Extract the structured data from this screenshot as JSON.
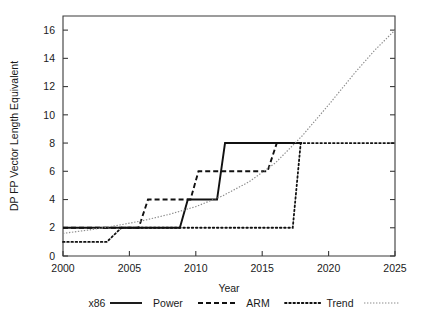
{
  "chart_data": {
    "type": "line",
    "title": "",
    "xlabel": "Year",
    "ylabel": "DP FP Vector Length Equivalent",
    "xlim": [
      2000,
      2025
    ],
    "ylim": [
      0,
      17
    ],
    "grid": false,
    "legend_position": "bottom",
    "xticks": [
      2000,
      2005,
      2010,
      2015,
      2020,
      2025
    ],
    "xticklabels": [
      "2000",
      "2005",
      "2010",
      "2015",
      "2020",
      "2025"
    ],
    "yticks": [
      0,
      2,
      4,
      6,
      8,
      10,
      12,
      14,
      16
    ],
    "yticklabels": [
      "0",
      "2",
      "4",
      "6",
      "8",
      "10",
      "12",
      "14",
      "16"
    ],
    "series": [
      {
        "name": "x86",
        "style": "solid",
        "color": "#111111",
        "step": true,
        "points": [
          [
            2000,
            2
          ],
          [
            2008.8,
            2
          ],
          [
            2009.4,
            4
          ],
          [
            2011.6,
            4
          ],
          [
            2012.2,
            8
          ],
          [
            2018.0,
            8
          ]
        ]
      },
      {
        "name": "Power",
        "style": "dashed",
        "color": "#111111",
        "step": true,
        "points": [
          [
            2000,
            2
          ],
          [
            2005.7,
            2
          ],
          [
            2006.4,
            4
          ],
          [
            2009.6,
            4
          ],
          [
            2010.2,
            6
          ],
          [
            2015.4,
            6
          ],
          [
            2016.1,
            8
          ],
          [
            2018.0,
            8
          ]
        ]
      },
      {
        "name": "ARM",
        "style": "dotted",
        "color": "#111111",
        "step": true,
        "points": [
          [
            2000,
            1
          ],
          [
            2003.3,
            1
          ],
          [
            2004.4,
            2
          ],
          [
            2017.3,
            2
          ],
          [
            2017.9,
            8
          ],
          [
            2025,
            8
          ]
        ]
      },
      {
        "name": "Trend",
        "style": "fine-dotted",
        "color": "#8c8c8c",
        "step": false,
        "points": [
          [
            2000,
            1.6
          ],
          [
            2002,
            1.85
          ],
          [
            2004,
            2.15
          ],
          [
            2006,
            2.5
          ],
          [
            2008,
            2.95
          ],
          [
            2010,
            3.5
          ],
          [
            2012,
            4.25
          ],
          [
            2014,
            5.25
          ],
          [
            2016,
            6.6
          ],
          [
            2018,
            8.5
          ],
          [
            2020,
            10.7
          ],
          [
            2022,
            13.0
          ],
          [
            2023.5,
            14.6
          ],
          [
            2025,
            16.0
          ]
        ]
      }
    ]
  },
  "legend": {
    "entries": [
      {
        "label": "x86",
        "style": "solid"
      },
      {
        "label": "Power",
        "style": "dashed"
      },
      {
        "label": "ARM",
        "style": "dotted"
      },
      {
        "label": "Trend",
        "style": "fine-dotted"
      }
    ]
  }
}
